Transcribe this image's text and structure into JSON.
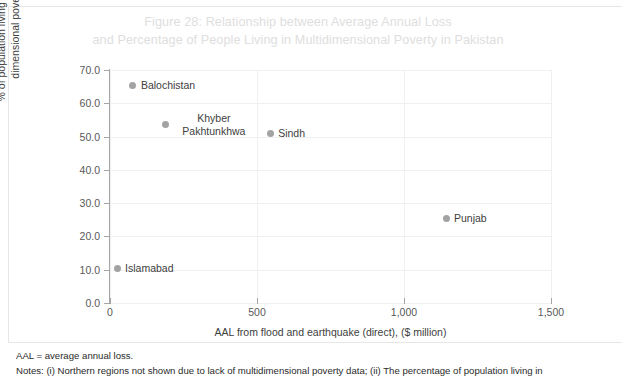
{
  "title": {
    "line1": "Figure 28: Relationship between Average Annual Loss",
    "line2": "and Percentage of People Living in Multidimensional Poverty in Pakistan",
    "color": "#dedede"
  },
  "footnotes": {
    "aal": "AAL = average annual loss.",
    "notes": "Notes: (i) Northern regions not shown due to lack of multidimensional poverty data; (ii) The percentage of population living in"
  },
  "axes": {
    "y_title_line1": "% of population living in multi-",
    "y_title_line2": "dimensional poverty",
    "x_title": "AAL from flood and earthquake (direct), ($ million)",
    "y_ticks": [
      "0.0",
      "10.0",
      "20.0",
      "30.0",
      "40.0",
      "50.0",
      "60.0",
      "70.0"
    ],
    "x_ticks": [
      "0",
      "500",
      "1,000",
      "1,500"
    ]
  },
  "chart_data": {
    "type": "scatter",
    "title": "Figure 28: Relationship between Average Annual Loss and Percentage of People Living in Multidimensional Poverty in Pakistan",
    "xlabel": "AAL from flood and earthquake (direct), ($ million)",
    "ylabel": "% of population living in multi-dimensional poverty",
    "xlim": [
      0,
      1500
    ],
    "ylim": [
      0,
      70
    ],
    "xticks": [
      0,
      500,
      1000,
      1500
    ],
    "yticks": [
      0,
      10,
      20,
      30,
      40,
      50,
      60,
      70
    ],
    "grid": true,
    "legend": "none",
    "marker_color": "#a3a3a3",
    "points": [
      {
        "label": "Balochistan",
        "x": 78,
        "y": 65.5,
        "label_pos": "right"
      },
      {
        "label": "Khyber Pakhtunkhwa",
        "x": 190,
        "y": 53.5,
        "label_pos": "right-two-line"
      },
      {
        "label": "Sindh",
        "x": 545,
        "y": 50.8,
        "label_pos": "right"
      },
      {
        "label": "Punjab",
        "x": 1143,
        "y": 25.5,
        "label_pos": "right"
      },
      {
        "label": "Islamabad",
        "x": 24,
        "y": 10.5,
        "label_pos": "right"
      }
    ]
  }
}
